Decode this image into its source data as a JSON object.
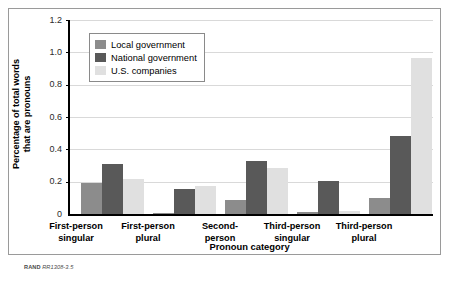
{
  "credit": {
    "brand": "RAND",
    "code": "RR1308-3.5"
  },
  "legend": {
    "position": "top-left-inside",
    "entries": [
      {
        "label": "Local government",
        "color": "#8c8c8c"
      },
      {
        "label": "National government",
        "color": "#595959"
      },
      {
        "label": "U.S. companies",
        "color": "#e0e0e0"
      }
    ]
  },
  "axes": {
    "y_title_line1": "Percentage of total words",
    "y_title_line2": "that are pronouns",
    "x_title": "Pronoun category",
    "y_ticks": [
      "0",
      "0.2",
      "0.4",
      "0.6",
      "0.8",
      "1.0",
      "1.2"
    ]
  },
  "chart_data": {
    "type": "bar",
    "title": "",
    "xlabel": "Pronoun category",
    "ylabel": "Percentage of total words that are pronouns",
    "ylim": [
      0,
      1.2
    ],
    "ytick_values": [
      0,
      0.2,
      0.4,
      0.6,
      0.8,
      1.0,
      1.2
    ],
    "grid": true,
    "legend_position": "upper left",
    "categories": [
      "First-person singular",
      "First-person plural",
      "Second-person",
      "Third-person singular",
      "Third-person plural"
    ],
    "category_lines": [
      [
        "First-person",
        "singular"
      ],
      [
        "First-person",
        "plural"
      ],
      [
        "Second-",
        "person"
      ],
      [
        "Third-person",
        "singular"
      ],
      [
        "Third-person",
        "plural"
      ]
    ],
    "series": [
      {
        "name": "Local government",
        "color": "#8c8c8c",
        "values": [
          0.19,
          0.005,
          0.085,
          0.015,
          0.1
        ]
      },
      {
        "name": "National government",
        "color": "#595959",
        "values": [
          0.31,
          0.155,
          0.325,
          0.205,
          0.48
        ]
      },
      {
        "name": "U.S. companies",
        "color": "#e0e0e0",
        "values": [
          0.215,
          0.175,
          0.285,
          0.02,
          0.965
        ]
      }
    ]
  }
}
